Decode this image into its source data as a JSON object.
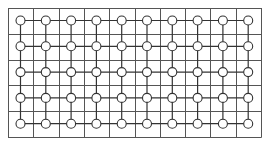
{
  "diagram": {
    "type": "grid-lattice",
    "width": 268,
    "height": 145,
    "colors": {
      "background": "#ffffff",
      "grid_line": "#555555",
      "connector_line": "#333333",
      "node_stroke": "#333333",
      "node_fill": "#ffffff"
    },
    "grid": {
      "left": 8,
      "top": 8,
      "right": 261,
      "bottom": 137,
      "columns": 10,
      "rows": 5
    },
    "nodes": {
      "columns": 10,
      "rows": 5,
      "first_x": 20.5,
      "first_y": 20.5,
      "step_x": 25.3,
      "step_y": 25.8,
      "radius": 4.5,
      "shape": "circle"
    }
  }
}
